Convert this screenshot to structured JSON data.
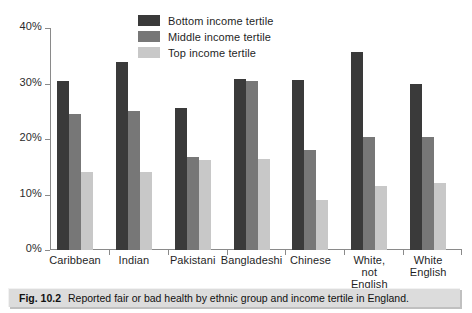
{
  "caption": {
    "number": "Fig. 10.2",
    "text": "Reported fair or bad health by ethnic group and income tertile in England."
  },
  "chart_data": {
    "type": "bar",
    "title": "",
    "xlabel": "",
    "ylabel": "",
    "ylim": [
      0,
      40
    ],
    "ytick_labels": [
      "0%",
      "10%",
      "20%",
      "30%",
      "40%"
    ],
    "ytick_values": [
      0,
      10,
      20,
      30,
      40
    ],
    "grid": false,
    "legend_position": "top-center",
    "categories": [
      "Caribbean",
      "Indian",
      "Pakistani",
      "Bangladeshi",
      "Chinese",
      "White, not\nEnglish",
      "White\nEnglish"
    ],
    "series": [
      {
        "name": "Bottom income tertile",
        "color": "#3a3a3a",
        "values": [
          30.5,
          33.8,
          25.5,
          30.9,
          30.7,
          35.6,
          30.0
        ]
      },
      {
        "name": "Middle income tertile",
        "color": "#777777",
        "values": [
          24.5,
          25.0,
          16.8,
          30.4,
          18.0,
          20.3,
          20.3
        ]
      },
      {
        "name": "Top income tertile",
        "color": "#c8c8c8",
        "values": [
          14.1,
          14.1,
          16.2,
          16.4,
          9.0,
          11.6,
          12.1
        ]
      }
    ]
  }
}
